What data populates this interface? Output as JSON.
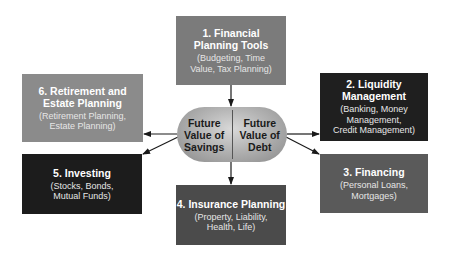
{
  "center": {
    "left_label": "Future Value of Savings",
    "left_lines": [
      "Future",
      "Value of",
      "Savings"
    ],
    "right_label": "Future Value of Debt",
    "right_lines": [
      "Future",
      "Value of",
      "Debt"
    ]
  },
  "boxes": [
    {
      "id": 1,
      "title_lines": [
        "1. Financial",
        "Planning Tools"
      ],
      "sub_lines": [
        "(Budgeting, Time",
        "Value, Tax Planning)"
      ],
      "color": "#7b7b7b"
    },
    {
      "id": 2,
      "title_lines": [
        "2. Liquidity",
        "Management"
      ],
      "sub_lines": [
        "(Banking, Money",
        "Management,",
        "Credit Management)"
      ],
      "color": "#1f1f1f"
    },
    {
      "id": 3,
      "title_lines": [
        "3. Financing"
      ],
      "sub_lines": [
        "(Personal Loans,",
        "Mortgages)"
      ],
      "color": "#5a5a5a"
    },
    {
      "id": 4,
      "title_lines": [
        "4. Insurance Planning"
      ],
      "sub_lines": [
        "(Property, Liability,",
        "Health, Life)"
      ],
      "color": "#4b4b4b"
    },
    {
      "id": 5,
      "title_lines": [
        "5. Investing"
      ],
      "sub_lines": [
        "(Stocks, Bonds,",
        "Mutual Funds)"
      ],
      "color": "#1c1c1c"
    },
    {
      "id": 6,
      "title_lines": [
        "6. Retirement and",
        "Estate Planning"
      ],
      "sub_lines": [
        "(Retirement Planning,",
        "Estate Planning)"
      ],
      "color": "#8b8b8b"
    }
  ],
  "arrows": [
    {
      "from": "box-1",
      "to": "center"
    },
    {
      "from": "center",
      "to": "box-2"
    },
    {
      "from": "center",
      "to": "box-3"
    },
    {
      "from": "center",
      "to": "box-4"
    },
    {
      "from": "center",
      "to": "box-5"
    },
    {
      "from": "center",
      "to": "box-6"
    }
  ]
}
